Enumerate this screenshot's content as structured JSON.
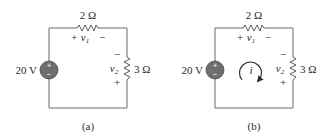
{
  "figures": [
    {
      "id": "a",
      "caption": "(a)",
      "source": {
        "label": "20 V",
        "plus": "+",
        "minus": "−",
        "fill": "#6e6e6e"
      },
      "resistor_top": {
        "label": "2 Ω",
        "v_name": "v",
        "v_sub": "1",
        "plus": "+",
        "minus": "−"
      },
      "resistor_right": {
        "label": "3 Ω",
        "v_name": "v",
        "v_sub": "2",
        "plus": "+",
        "minus": "−"
      },
      "current_loop": null
    },
    {
      "id": "b",
      "caption": "(b)",
      "source": {
        "label": "20 V",
        "plus": "+",
        "minus": "−",
        "fill": "#6e6e6e"
      },
      "resistor_top": {
        "label": "2 Ω",
        "v_name": "v",
        "v_sub": "1",
        "plus": "+",
        "minus": "−"
      },
      "resistor_right": {
        "label": "3 Ω",
        "v_name": "v",
        "v_sub": "2",
        "plus": "+",
        "minus": "−"
      },
      "current_loop": {
        "label": "i",
        "direction": "clockwise"
      }
    }
  ],
  "colors": {
    "wire": "#6a6a6a",
    "text": "#2a2a2a",
    "source_fill": "#6e6e6e"
  }
}
